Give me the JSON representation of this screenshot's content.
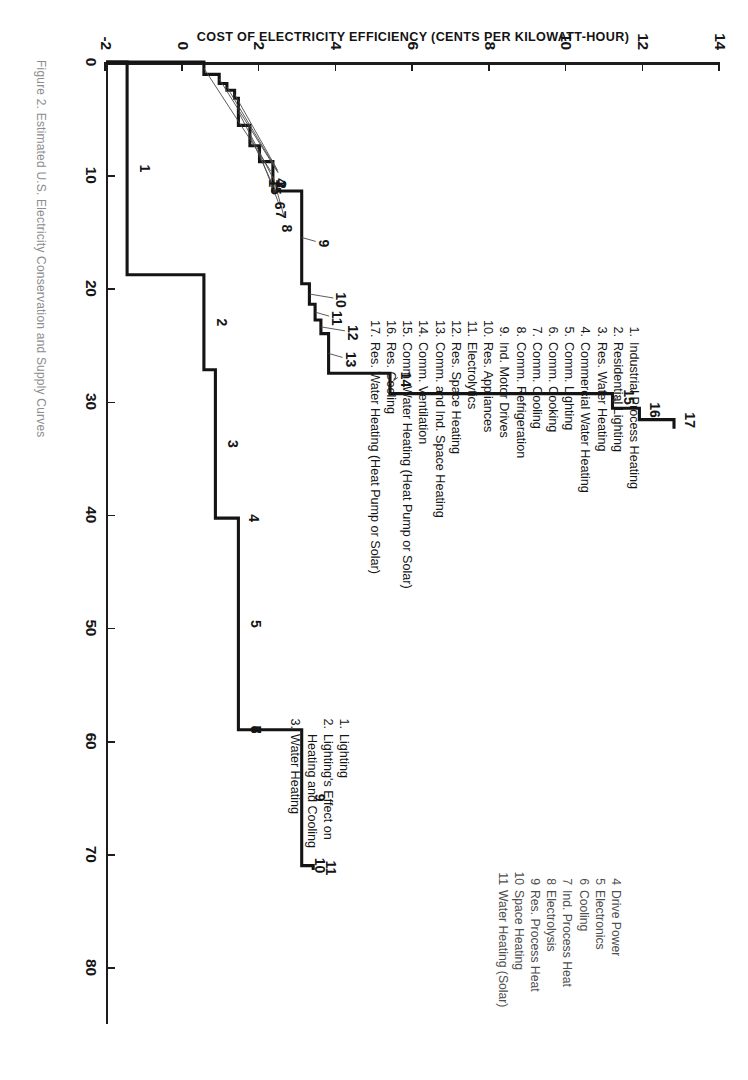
{
  "figure": {
    "caption": "Figure 2.  Estimated U.S. Electricity Conservation and Supply Curves"
  },
  "chart_data": {
    "type": "line",
    "subtype": "step-supply-curve",
    "title": "",
    "xlabel": "",
    "ylabel": "COST OF ELECTRICITY EFFICIENCY (CENTS PER KILOWATT-HOUR)",
    "xlim": [
      0,
      85
    ],
    "ylim": [
      -2,
      14
    ],
    "xticks": [
      0,
      10,
      20,
      30,
      40,
      50,
      60,
      70,
      80
    ],
    "yticks": [
      -2,
      0,
      2,
      4,
      6,
      8,
      10,
      12,
      14
    ],
    "grid": false,
    "legend_position": "inside-upper-left",
    "series": [
      {
        "name": "Conservation (efficiency) supply curve",
        "note": "17 measures, ascending cost steps",
        "steps": [
          {
            "id": 1,
            "x_start": 0.0,
            "x_end": 1.1,
            "y": 0.55
          },
          {
            "id": 2,
            "x_start": 1.1,
            "x_end": 1.9,
            "y": 0.95
          },
          {
            "id": 3,
            "x_start": 1.9,
            "x_end": 2.5,
            "y": 1.15
          },
          {
            "id": 4,
            "x_start": 2.5,
            "x_end": 3.2,
            "y": 1.35
          },
          {
            "id": 5,
            "x_start": 3.2,
            "x_end": 5.6,
            "y": 1.45
          },
          {
            "id": 6,
            "x_start": 5.6,
            "x_end": 7.4,
            "y": 1.75
          },
          {
            "id": 7,
            "x_start": 7.4,
            "x_end": 8.8,
            "y": 2.0
          },
          {
            "id": 8,
            "x_start": 8.8,
            "x_end": 11.4,
            "y": 2.35
          },
          {
            "id": 9,
            "x_start": 11.4,
            "x_end": 19.6,
            "y": 3.1
          },
          {
            "id": 10,
            "x_start": 19.6,
            "x_end": 21.4,
            "y": 3.3
          },
          {
            "id": 11,
            "x_start": 21.4,
            "x_end": 22.8,
            "y": 3.45
          },
          {
            "id": 12,
            "x_start": 22.8,
            "x_end": 24.0,
            "y": 3.6
          },
          {
            "id": 13,
            "x_start": 24.0,
            "x_end": 27.5,
            "y": 3.8
          },
          {
            "id": 14,
            "x_start": 27.5,
            "x_end": 29.3,
            "y": 5.4
          },
          {
            "id": 15,
            "x_start": 29.3,
            "x_end": 30.6,
            "y": 11.2
          },
          {
            "id": 16,
            "x_start": 30.6,
            "x_end": 31.6,
            "y": 11.9
          },
          {
            "id": 17,
            "x_start": 31.6,
            "x_end": 32.4,
            "y": 12.8
          }
        ]
      },
      {
        "name": "Electricity supply / end-use curve",
        "note": "11 categories, lower curve",
        "steps": [
          {
            "id": 1,
            "x_start": 0.0,
            "x_end": 18.8,
            "y": -1.45
          },
          {
            "id": 2,
            "x_start": 18.8,
            "x_end": 27.2,
            "y": 0.55
          },
          {
            "id": 3,
            "x_start": 27.2,
            "x_end": 40.3,
            "y": 0.85
          },
          {
            "id": 4,
            "x_start": 40.3,
            "x_end": 40.3,
            "y": 1.4
          },
          {
            "id": 5,
            "x_start": 40.3,
            "x_end": 59.0,
            "y": 1.45
          },
          {
            "id": 6,
            "x_start": 59.0,
            "x_end": 59.0,
            "y": 1.45
          },
          {
            "id": 7,
            "x_start": 59.0,
            "x_end": 59.0,
            "y": 1.45
          },
          {
            "id": 8,
            "x_start": 59.0,
            "x_end": 59.0,
            "y": 1.45
          },
          {
            "id": 9,
            "x_start": 59.0,
            "x_end": 71.0,
            "y": 3.1
          },
          {
            "id": 10,
            "x_start": 71.0,
            "x_end": 71.0,
            "y": 3.1
          },
          {
            "id": 11,
            "x_start": 71.0,
            "x_end": 71.4,
            "y": 3.4
          }
        ]
      }
    ],
    "point_labels_upper": [
      "1",
      "2",
      "3",
      "4",
      "5",
      "6",
      "7",
      "8",
      "9",
      "10",
      "11",
      "12",
      "13",
      "14",
      "15",
      "16",
      "17"
    ],
    "point_labels_lower": [
      "1",
      "2",
      "3",
      "4",
      "5",
      "6",
      "7",
      "8",
      "9",
      "10",
      "11"
    ]
  },
  "legend_conservation": {
    "items": [
      {
        "num": "1.",
        "label": "Industrial Process Heating"
      },
      {
        "num": "2.",
        "label": "Residential Lighting"
      },
      {
        "num": "3.",
        "label": "Res. Water Heating"
      },
      {
        "num": "4.",
        "label": "Commercial Water Heating"
      },
      {
        "num": "5.",
        "label": "Comm. Lighting"
      },
      {
        "num": "6.",
        "label": "Comm. Cooking"
      },
      {
        "num": "7.",
        "label": "Comm. Cooling"
      },
      {
        "num": "8.",
        "label": "Comm. Refrigeration"
      },
      {
        "num": "9.",
        "label": "Ind. Motor Drives"
      },
      {
        "num": "10.",
        "label": "Res. Appliances"
      },
      {
        "num": "11.",
        "label": "Electrolytics"
      },
      {
        "num": "12.",
        "label": "Res. Space Heating"
      },
      {
        "num": "13.",
        "label": "Comm. and Ind. Space Heating"
      },
      {
        "num": "14.",
        "label": "Comm. Ventilation"
      },
      {
        "num": "15.",
        "label": "Comm. Water Heating (Heat Pump or Solar)"
      },
      {
        "num": "16.",
        "label": "Res. Cooling"
      },
      {
        "num": "17.",
        "label": "Res. Water Heating (Heat Pump or Solar)"
      }
    ]
  },
  "legend_enduse_left": {
    "items": [
      {
        "num": "1.",
        "label": "Lighting"
      },
      {
        "num": "2.",
        "label": "Lighting's Effect on"
      },
      {
        "num": "",
        "label": "Heating and Cooling"
      },
      {
        "num": "3.",
        "label": "Water Heating"
      }
    ]
  },
  "legend_enduse_right": {
    "items": [
      {
        "num": "4",
        "label": "Drive Power"
      },
      {
        "num": "5",
        "label": "Electronics"
      },
      {
        "num": "6",
        "label": "Cooling"
      },
      {
        "num": "7",
        "label": "Ind. Process Heat"
      },
      {
        "num": "8",
        "label": "Electrolysis"
      },
      {
        "num": "9",
        "label": "Res. Process Heat"
      },
      {
        "num": "10",
        "label": "Space Heating"
      },
      {
        "num": "11",
        "label": "Water Heating (Solar)"
      }
    ]
  },
  "axis": {
    "y_label": "COST OF ELECTRICITY EFFICIENCY (CENTS PER KILOWATT-HOUR)",
    "xticks": [
      "0",
      "10",
      "20",
      "30",
      "40",
      "50",
      "60",
      "70",
      "80"
    ],
    "yticks": [
      "14",
      "12",
      "10",
      "8",
      "6",
      "4",
      "2",
      "0",
      "-2"
    ]
  }
}
